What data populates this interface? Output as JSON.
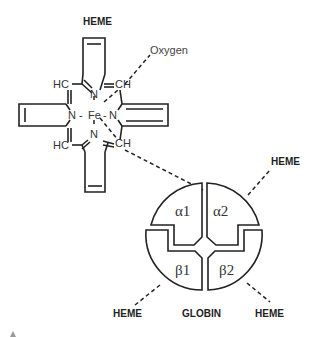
{
  "diagram": {
    "heme_title": "HEME",
    "oxygen_label": "Oxygen",
    "heme_atoms": {
      "hc_top": "HC",
      "ch_top": "CH",
      "n_top": "N",
      "n_left": "N",
      "fe": "Fe",
      "n_right": "N",
      "n_bottom": "N",
      "hc_bottom": "HC",
      "ch_bottom": "CH",
      "dash_left": "-",
      "dash_right": "-"
    },
    "globin": {
      "label": "GLOBIN",
      "subunits": [
        "α1",
        "α2",
        "β1",
        "β2"
      ]
    },
    "heme_labels": {
      "top_right": "HEME",
      "bottom_left": "HEME",
      "bottom_right": "HEME"
    }
  }
}
